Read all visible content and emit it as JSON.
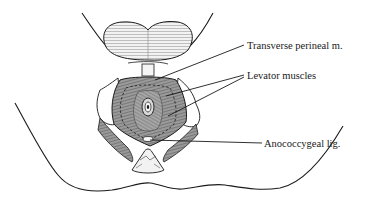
{
  "figure": {
    "labels": [
      {
        "id": "transverse-perineal",
        "text": "Transverse perineal m.",
        "x": 247,
        "y": 41
      },
      {
        "id": "levator-muscles",
        "text": "Levator muscles",
        "x": 247,
        "y": 71
      },
      {
        "id": "anococcygeal-lig",
        "text": "Anococcygeal lig.",
        "x": 264,
        "y": 140
      }
    ],
    "colors": {
      "ink": "#1a1a1a",
      "muscle_fill": "#8a8a8a",
      "muscle_dark": "#555555",
      "light_fill": "#e8e8e8",
      "background": "#ffffff"
    }
  }
}
